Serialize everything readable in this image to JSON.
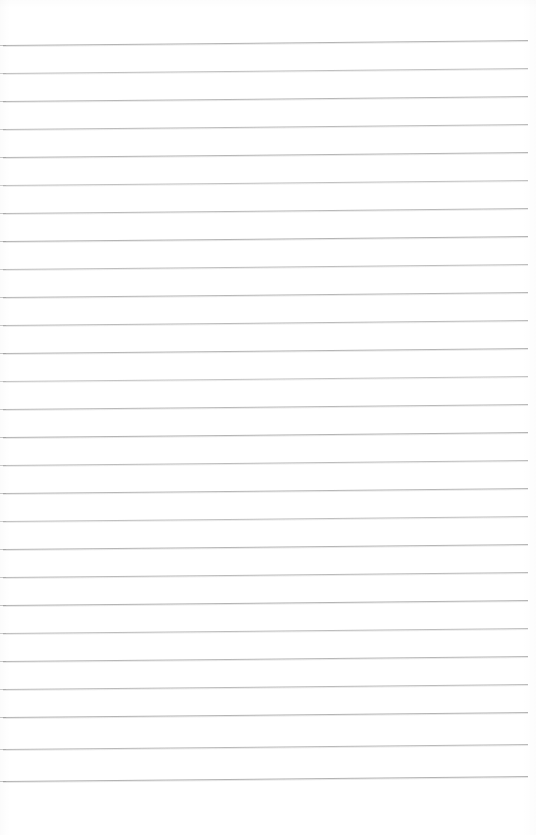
{
  "document": {
    "kind": "scanned-ruled-paper",
    "title": "Blank ruled notebook page",
    "page_width": 536,
    "page_height": 835,
    "background_color": "#ffffff",
    "has_text": false,
    "has_handwriting": false,
    "has_margin_rule": false,
    "has_header": false,
    "has_footer": false,
    "has_page_number": false,
    "body_text": ""
  },
  "ruling": {
    "line_color": "#b0b0b0",
    "line_thickness_px": 1,
    "line_count": 27,
    "line_spacing_px": 28,
    "first_line_y": 45,
    "last_line_y": 781,
    "line_start_x": 3,
    "line_end_x": 528,
    "top_margin_px": 45,
    "bottom_margin_px": 54,
    "left_margin_px": 3,
    "right_margin_px": 8,
    "skew_rise_px": 5,
    "lines": [
      {
        "index": 1,
        "y": 45,
        "x1": 3,
        "x2": 528,
        "opacity": 0.95
      },
      {
        "index": 2,
        "y": 73,
        "x1": 3,
        "x2": 528,
        "opacity": 0.8
      },
      {
        "index": 3,
        "y": 101,
        "x1": 3,
        "x2": 528,
        "opacity": 0.9
      },
      {
        "index": 4,
        "y": 129,
        "x1": 3,
        "x2": 528,
        "opacity": 0.85
      },
      {
        "index": 5,
        "y": 157,
        "x1": 3,
        "x2": 528,
        "opacity": 0.92
      },
      {
        "index": 6,
        "y": 185,
        "x1": 3,
        "x2": 528,
        "opacity": 0.78
      },
      {
        "index": 7,
        "y": 213,
        "x1": 3,
        "x2": 528,
        "opacity": 0.88
      },
      {
        "index": 8,
        "y": 241,
        "x1": 3,
        "x2": 528,
        "opacity": 0.95
      },
      {
        "index": 9,
        "y": 269,
        "x1": 3,
        "x2": 528,
        "opacity": 0.82
      },
      {
        "index": 10,
        "y": 297,
        "x1": 3,
        "x2": 528,
        "opacity": 0.9
      },
      {
        "index": 11,
        "y": 325,
        "x1": 3,
        "x2": 528,
        "opacity": 0.86
      },
      {
        "index": 12,
        "y": 353,
        "x1": 3,
        "x2": 528,
        "opacity": 0.93
      },
      {
        "index": 13,
        "y": 381,
        "x1": 3,
        "x2": 528,
        "opacity": 0.75
      },
      {
        "index": 14,
        "y": 409,
        "x1": 3,
        "x2": 528,
        "opacity": 0.88
      },
      {
        "index": 15,
        "y": 437,
        "x1": 3,
        "x2": 528,
        "opacity": 0.95
      },
      {
        "index": 16,
        "y": 465,
        "x1": 3,
        "x2": 528,
        "opacity": 0.84
      },
      {
        "index": 17,
        "y": 493,
        "x1": 3,
        "x2": 528,
        "opacity": 0.9
      },
      {
        "index": 18,
        "y": 521,
        "x1": 3,
        "x2": 528,
        "opacity": 0.8
      },
      {
        "index": 19,
        "y": 549,
        "x1": 3,
        "x2": 528,
        "opacity": 0.92
      },
      {
        "index": 20,
        "y": 577,
        "x1": 3,
        "x2": 528,
        "opacity": 0.87
      },
      {
        "index": 21,
        "y": 605,
        "x1": 3,
        "x2": 528,
        "opacity": 0.95
      },
      {
        "index": 22,
        "y": 633,
        "x1": 3,
        "x2": 528,
        "opacity": 0.83
      },
      {
        "index": 23,
        "y": 661,
        "x1": 3,
        "x2": 528,
        "opacity": 0.9
      },
      {
        "index": 24,
        "y": 689,
        "x1": 3,
        "x2": 528,
        "opacity": 0.86
      },
      {
        "index": 25,
        "y": 717,
        "x1": 3,
        "x2": 528,
        "opacity": 0.94
      },
      {
        "index": 26,
        "y": 749,
        "x1": 3,
        "x2": 528,
        "opacity": 0.88
      },
      {
        "index": 27,
        "y": 781,
        "x1": 3,
        "x2": 528,
        "opacity": 0.96
      }
    ]
  }
}
